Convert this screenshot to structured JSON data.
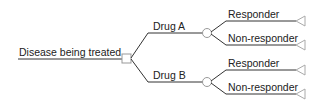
{
  "diagram": {
    "type": "decision-tree",
    "root": {
      "label": "Disease being treated",
      "node_type": "decision"
    },
    "branches": [
      {
        "label": "Drug A",
        "node_type": "chance",
        "outcomes": [
          {
            "label": "Responder",
            "node_type": "terminal"
          },
          {
            "label": "Non-responder",
            "node_type": "terminal"
          }
        ]
      },
      {
        "label": "Drug B",
        "node_type": "chance",
        "outcomes": [
          {
            "label": "Responder",
            "node_type": "terminal"
          },
          {
            "label": "Non-responder",
            "node_type": "terminal"
          }
        ]
      }
    ],
    "colors": {
      "line": "#333333",
      "node_stroke": "#999999",
      "text": "#222222"
    }
  }
}
